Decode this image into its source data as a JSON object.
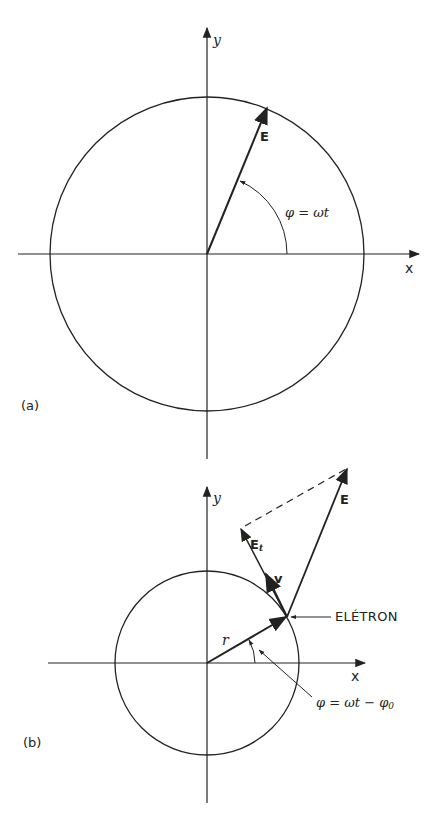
{
  "panel_a": {
    "tag": "(a)",
    "x_axis_label": "x",
    "y_axis_label": "y",
    "vector_label": "E",
    "angle_label": "φ = ωt",
    "vector_angle_deg": 67.7
  },
  "panel_b": {
    "tag": "(b)",
    "x_axis_label": "x",
    "y_axis_label": "y",
    "field_label": "E",
    "tangential_label_main": "E",
    "tangential_label_sub": "t",
    "velocity_label": "v",
    "radius_label": "r",
    "electron_label": "ELÉTRON",
    "angle_label_main": "φ = ωt − φ",
    "angle_label_sub": "0",
    "radius_angle_deg": 30
  },
  "colors": {
    "line": "#222222",
    "background": "#ffffff"
  }
}
